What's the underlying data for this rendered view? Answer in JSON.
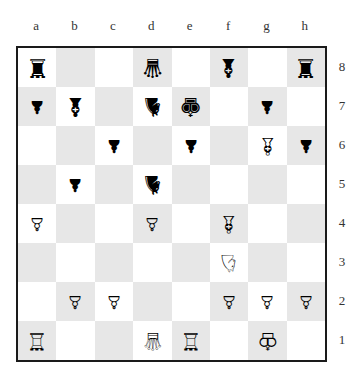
{
  "files": [
    "a",
    "b",
    "c",
    "d",
    "e",
    "f",
    "g",
    "h"
  ],
  "ranks": [
    "8",
    "7",
    "6",
    "5",
    "4",
    "3",
    "2",
    "1"
  ],
  "colors": {
    "light": "#ffffff",
    "dark": "#e7e7e7",
    "border": "#1a1a1a"
  },
  "board": [
    [
      "♜",
      "",
      "",
      "♛",
      "",
      "♝",
      "",
      "♜"
    ],
    [
      "♟",
      "♝",
      "",
      "♞",
      "♚",
      "",
      "♟",
      ""
    ],
    [
      "",
      "",
      "♟",
      "",
      "♟",
      "",
      "♗",
      "♟"
    ],
    [
      "",
      "♟",
      "",
      "♞",
      "",
      "",
      "",
      ""
    ],
    [
      "♙",
      "",
      "",
      "♙",
      "",
      "♗",
      "",
      ""
    ],
    [
      "",
      "",
      "",
      "",
      "",
      "♘",
      "",
      ""
    ],
    [
      "",
      "♙",
      "♙",
      "",
      "",
      "♙",
      "♙",
      "♙"
    ],
    [
      "♖",
      "",
      "",
      "♕",
      "♖",
      "",
      "♔",
      ""
    ]
  ],
  "pieces": {
    "a8": "black-rook",
    "d8": "black-queen",
    "f8": "black-bishop",
    "h8": "black-rook",
    "a7": "black-pawn",
    "b7": "black-bishop",
    "d7": "black-knight",
    "e7": "black-king",
    "g7": "black-pawn",
    "c6": "black-pawn",
    "e6": "black-pawn",
    "g6": "white-bishop",
    "h6": "black-pawn",
    "b5": "black-pawn",
    "d5": "black-knight",
    "a4": "white-pawn",
    "d4": "white-pawn",
    "f4": "white-bishop",
    "f3": "white-knight",
    "b2": "white-pawn",
    "c2": "white-pawn",
    "f2": "white-pawn",
    "g2": "white-pawn",
    "h2": "white-pawn",
    "a1": "white-rook",
    "d1": "white-queen",
    "e1": "white-rook",
    "g1": "white-king"
  }
}
